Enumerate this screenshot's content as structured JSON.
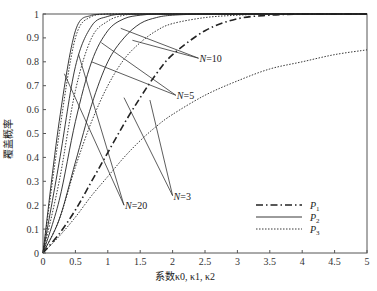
{
  "chart_data": {
    "type": "line",
    "title": "",
    "xlabel": "系数κ0, κ1, κ2",
    "ylabel": "覆盖概率",
    "xlim": [
      0,
      5
    ],
    "ylim": [
      0,
      1
    ],
    "grid": false,
    "xticks": [
      "0",
      "0.5",
      "1",
      "1.5",
      "2",
      "2.5",
      "3",
      "3.5",
      "4",
      "4.5",
      "5"
    ],
    "yticks": [
      "0",
      "0.1",
      "0.2",
      "0.3",
      "0.4",
      "0.5",
      "0.6",
      "0.7",
      "0.8",
      "0.9",
      "1"
    ],
    "legend": {
      "placement": "bottom-right",
      "entries": [
        {
          "label": "P",
          "sub": "1",
          "style": "dash-dot"
        },
        {
          "label": "P",
          "sub": "2",
          "style": "solid"
        },
        {
          "label": "P",
          "sub": "3",
          "style": "dotted"
        }
      ]
    },
    "x": [
      0,
      0.25,
      0.5,
      0.75,
      1,
      1.25,
      1.5,
      1.75,
      2,
      2.5,
      3,
      3.5,
      4,
      4.5,
      5
    ],
    "series": [
      {
        "name": "P1",
        "style": "dash-dot",
        "values": [
          0,
          0.08,
          0.18,
          0.3,
          0.42,
          0.54,
          0.65,
          0.75,
          0.83,
          0.93,
          0.98,
          0.995,
          1,
          1,
          1
        ]
      },
      {
        "name": "P2 N=20",
        "style": "solid",
        "values": [
          0,
          0.55,
          0.93,
          0.995,
          1,
          1,
          1,
          1,
          1,
          1,
          1,
          1,
          1,
          1,
          1
        ]
      },
      {
        "name": "P2 N=10",
        "style": "solid",
        "values": [
          0,
          0.38,
          0.78,
          0.95,
          0.99,
          1,
          1,
          1,
          1,
          1,
          1,
          1,
          1,
          1,
          1
        ]
      },
      {
        "name": "P2 N=5",
        "style": "solid",
        "values": [
          0,
          0.22,
          0.55,
          0.8,
          0.93,
          0.98,
          0.995,
          1,
          1,
          1,
          1,
          1,
          1,
          1,
          1
        ]
      },
      {
        "name": "P2 N=3",
        "style": "solid",
        "values": [
          0,
          0.14,
          0.38,
          0.62,
          0.8,
          0.9,
          0.96,
          0.985,
          0.995,
          1,
          1,
          1,
          1,
          1,
          1
        ]
      },
      {
        "name": "P3 N=20",
        "style": "dotted",
        "values": [
          0,
          0.5,
          0.9,
          0.99,
          1,
          1,
          1,
          1,
          1,
          1,
          1,
          1,
          1,
          1,
          1
        ]
      },
      {
        "name": "P3 N=10",
        "style": "dotted",
        "values": [
          0,
          0.3,
          0.68,
          0.9,
          0.97,
          0.995,
          1,
          1,
          1,
          1,
          1,
          1,
          1,
          1,
          1
        ]
      },
      {
        "name": "P3 N=5",
        "style": "dotted",
        "values": [
          0,
          0.14,
          0.36,
          0.55,
          0.7,
          0.81,
          0.88,
          0.93,
          0.96,
          0.985,
          0.995,
          1,
          1,
          1,
          1
        ]
      },
      {
        "name": "P3 N=3",
        "style": "dotted",
        "values": [
          0,
          0.07,
          0.15,
          0.24,
          0.32,
          0.4,
          0.47,
          0.53,
          0.58,
          0.66,
          0.72,
          0.77,
          0.8,
          0.83,
          0.85
        ]
      }
    ],
    "annotations": [
      {
        "text_var": "N",
        "text_val": "=10",
        "xy": [
          2.4,
          0.815
        ],
        "points_to": [
          [
            1.38,
            0.89
          ],
          [
            1.2,
            0.94
          ]
        ]
      },
      {
        "text_var": "N",
        "text_val": "=5",
        "xy": [
          2.05,
          0.66
        ],
        "points_to": [
          [
            0.75,
            0.8
          ],
          [
            0.9,
            0.88
          ]
        ]
      },
      {
        "text_var": "N",
        "text_val": "=3",
        "xy": [
          2.0,
          0.24
        ],
        "points_to": [
          [
            1.25,
            0.65
          ],
          [
            1.65,
            0.64
          ]
        ]
      },
      {
        "text_var": "N",
        "text_val": "=20",
        "xy": [
          1.25,
          0.2
        ],
        "points_to": [
          [
            0.33,
            0.75
          ],
          [
            0.55,
            0.83
          ]
        ]
      }
    ]
  }
}
